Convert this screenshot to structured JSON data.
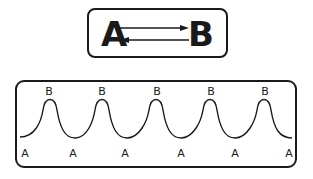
{
  "equilibrium": {
    "left": "A",
    "right": "B",
    "arrow": "reversible-equilibrium"
  },
  "oscillation": {
    "peak_labels": [
      "B",
      "B",
      "B",
      "B",
      "B"
    ],
    "trough_labels": [
      "A",
      "A",
      "A",
      "A",
      "A",
      "A"
    ]
  },
  "colors": {
    "stroke": "#1a1a1a",
    "background": "#ffffff"
  }
}
